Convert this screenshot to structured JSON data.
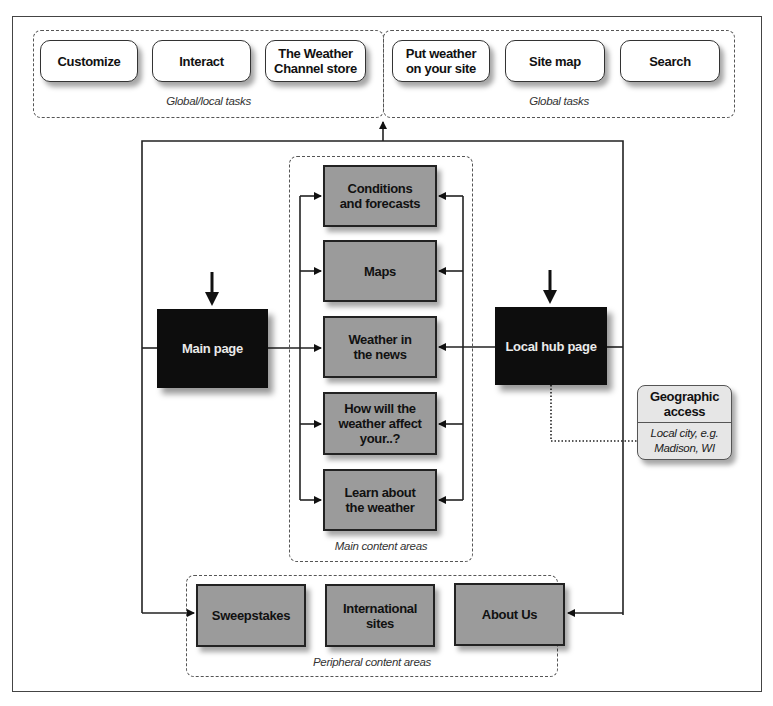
{
  "diagram": {
    "global_local_tasks": {
      "caption": "Global/local tasks",
      "items": [
        {
          "label": "Customize"
        },
        {
          "label": "Interact"
        },
        {
          "label": "The Weather Channel store"
        }
      ]
    },
    "global_tasks": {
      "caption": "Global tasks",
      "items": [
        {
          "label": "Put weather on your site"
        },
        {
          "label": "Site map"
        },
        {
          "label": "Search"
        }
      ]
    },
    "entry_pages": {
      "main_page": "Main page",
      "local_hub_page": "Local hub page"
    },
    "main_content_areas": {
      "caption": "Main content areas",
      "items": [
        {
          "label": "Conditions and forecasts"
        },
        {
          "label": "Maps"
        },
        {
          "label": "Weather in the news"
        },
        {
          "label": "How will the weather affect your..?"
        },
        {
          "label": "Learn about the weather"
        }
      ]
    },
    "peripheral_content_areas": {
      "caption": "Peripheral content areas",
      "items": [
        {
          "label": "Sweepstakes"
        },
        {
          "label": "International sites"
        },
        {
          "label": "About Us"
        }
      ]
    },
    "geographic_access": {
      "title": "Geographic access",
      "subtitle": "Local city, e.g. Madison, WI"
    },
    "colors": {
      "content_box": "#9b9b9b",
      "page_box": "#0d0d0d",
      "geo_box": "#e6e6e6",
      "line": "#222222"
    }
  }
}
